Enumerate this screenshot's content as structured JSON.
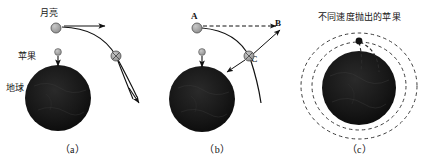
{
  "figure": {
    "background_color": "#ffffff",
    "ink_color": "#111111",
    "globe_color": "#151515",
    "body_fill": "#9a9a9a"
  },
  "panels": [
    {
      "id": "a",
      "caption": "（a）",
      "labels": {
        "moon": "月亮",
        "apple": "苹果",
        "earth": "地球"
      },
      "objects": {
        "moon_body": "moon-circle",
        "moon_second_body": "moon-circle-crossed",
        "apple_body": "apple-dot",
        "earth_body": "earth-globe"
      },
      "vectors": [
        {
          "name": "moon-velocity-arrow",
          "direction": "right"
        },
        {
          "name": "apple-fall-arrow",
          "direction": "down"
        },
        {
          "name": "moon-trajectory-arrow",
          "direction": "down-right"
        }
      ]
    },
    {
      "id": "b",
      "caption": "（b）",
      "labels": {
        "point_a": "A",
        "point_b": "B",
        "point_c": "C"
      },
      "objects": {
        "moon_body": "moon-circle",
        "moon_at_c": "moon-circle-crossed",
        "apple_body": "apple-dot",
        "earth_body": "earth-globe"
      },
      "vectors": [
        {
          "name": "tangent-dashed-arrow",
          "direction": "right"
        },
        {
          "name": "apple-fall-arrow",
          "direction": "down"
        },
        {
          "name": "gravity-arrow-at-c",
          "direction": "down-left"
        },
        {
          "name": "displacement-arrow-bc",
          "direction": "up-right"
        }
      ]
    },
    {
      "id": "c",
      "caption": "（c）",
      "title": "不同速度抛出的苹果",
      "objects": {
        "launch_point": "launch-dot",
        "earth_body": "earth-globe"
      },
      "orbits": [
        {
          "name": "short-fall-arc",
          "style": "dashed"
        },
        {
          "name": "long-fall-arc",
          "style": "dashed"
        },
        {
          "name": "inner-orbit-ellipse",
          "style": "dashed"
        },
        {
          "name": "outer-orbit-ellipse",
          "style": "dashed"
        }
      ]
    }
  ]
}
